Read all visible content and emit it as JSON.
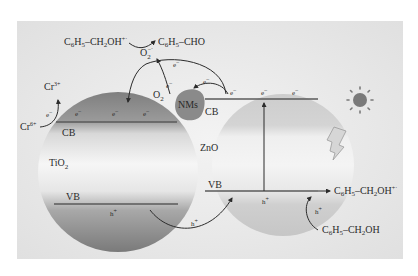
{
  "diagram": {
    "colors": {
      "panel_bg": "#e6e6e6",
      "tio2_dark": "#7d7d7d",
      "tio2_light": "#f2f2f2",
      "zno_fill": "#c9c9c9",
      "nms_fill": "#8a8a8a",
      "band_line": "#5a5a5a",
      "text": "#2b2b2b",
      "sun": "#7a7a7a"
    },
    "materials": {
      "tio2": "TiO",
      "tio2_sub": "2",
      "zno": "ZnO",
      "nms": "NMs"
    },
    "bands": {
      "tio2_cb": "CB",
      "tio2_vb": "VB",
      "zno_cb": "CB",
      "zno_vb": "VB"
    },
    "carriers": {
      "electron": "e",
      "electron_sup": "−",
      "hole": "h",
      "hole_sup": "+"
    },
    "reactions": {
      "top_reactant": {
        "main": "C",
        "s1": "6",
        "mid": "H",
        "s2": "5",
        "tail": "–CH",
        "s3": "2",
        "end": "OH",
        "sup": "+·"
      },
      "top_product": {
        "main": "C",
        "s1": "6",
        "mid": "H",
        "s2": "5",
        "tail": "–CHO"
      },
      "superoxide": {
        "main": "O",
        "sub": "2",
        "sup": "−·"
      },
      "oxygen": {
        "main": "O",
        "sub": "2"
      },
      "cr6": {
        "main": "Cr",
        "sup": "6+"
      },
      "cr3": {
        "main": "Cr",
        "sup": "3+"
      },
      "right_product": {
        "main": "C",
        "s1": "6",
        "mid": "H",
        "s2": "5",
        "tail": "–CH",
        "s3": "2",
        "end": "OH",
        "sup": "+·"
      },
      "right_reactant": {
        "main": "C",
        "s1": "6",
        "mid": "H",
        "s2": "5",
        "tail": "–CH",
        "s3": "2",
        "end": "OH"
      }
    },
    "icons": {
      "sun": "sun-icon",
      "light": "lightning-bolt-icon"
    }
  }
}
